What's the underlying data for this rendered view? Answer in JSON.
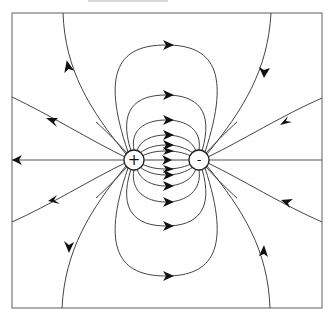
{
  "diagram": {
    "frame": {
      "x": 12,
      "y": 13,
      "width": 310,
      "height": 295
    },
    "colors": {
      "frame": "#7a7a7a",
      "lines": "#444444",
      "arrows": "#111111",
      "background": "#ffffff"
    },
    "charges": [
      {
        "id": "positive",
        "sign": "+",
        "cx": 134,
        "cy": 160,
        "r": 10
      },
      {
        "id": "negative",
        "sign": "-",
        "cx": 199,
        "cy": 160,
        "r": 10
      }
    ],
    "inner_loops_apex_y": {
      "upper": [
        45,
        95,
        120,
        135,
        145,
        151
      ],
      "lower": [
        276,
        226,
        202,
        186,
        178,
        172
      ]
    },
    "axis_line_y": 160,
    "outer_lines": {
      "left_upper_edge_y": 97,
      "left_lower_edge_y": 222,
      "right_upper_edge_y": 98,
      "right_lower_edge_y": 222,
      "top_left_edge_x": 63,
      "top_right_edge_x": 271,
      "bottom_left_edge_x": 62,
      "bottom_right_edge_x": 270
    },
    "field_direction": "from + to -"
  }
}
